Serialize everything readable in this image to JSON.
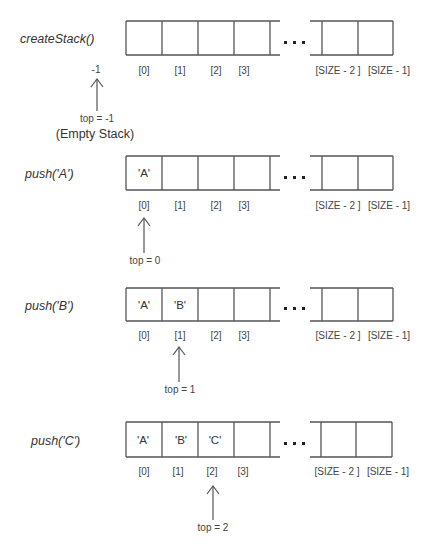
{
  "diagram": {
    "index_labels": [
      "[0]",
      "[1]",
      "[2]",
      "[3]",
      "[SIZE - 2 ]",
      "[SIZE - 1]"
    ],
    "ellipsis": "...",
    "rows": [
      {
        "operation": "createStack()",
        "cells": [
          "",
          "",
          "",
          ""
        ],
        "pointer_index": -1,
        "pointer_marker": "-1",
        "pointer_label": "top = -1",
        "note": "(Empty Stack)"
      },
      {
        "operation": "push('A')",
        "cells": [
          "'A'",
          "",
          "",
          ""
        ],
        "pointer_index": 0,
        "pointer_label": "top = 0"
      },
      {
        "operation": "push('B')",
        "cells": [
          "'A'",
          "'B'",
          "",
          ""
        ],
        "pointer_index": 1,
        "pointer_label": "top = 1"
      },
      {
        "operation": "push('C')",
        "cells": [
          "'A'",
          "'B'",
          "'C'",
          ""
        ],
        "pointer_index": 2,
        "pointer_label": "top = 2"
      }
    ]
  },
  "colors": {
    "line": "#555555",
    "text": "#333333",
    "background": "#ffffff"
  }
}
